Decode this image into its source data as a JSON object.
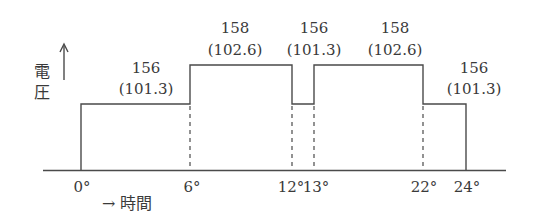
{
  "diagram": {
    "type": "step-voltage-time",
    "y_axis_label": [
      "電",
      "圧"
    ],
    "x_axis_label": "→ 時間",
    "colors": {
      "line": "#4a4a4a",
      "text": "#3a3a3a",
      "background": "#ffffff"
    },
    "segments": [
      {
        "from": "0°",
        "to": "6°",
        "value": "156",
        "sub": "(101.3)",
        "level": "low"
      },
      {
        "from": "6°",
        "to": "12°",
        "value": "158",
        "sub": "(102.6)",
        "level": "high"
      },
      {
        "from": "12°",
        "to": "13°",
        "value": "156",
        "sub": "(101.3)",
        "level": "low"
      },
      {
        "from": "13°",
        "to": "22°",
        "value": "158",
        "sub": "(102.6)",
        "level": "high"
      },
      {
        "from": "22°",
        "to": "24°",
        "value": "156",
        "sub": "(101.3)",
        "level": "low"
      }
    ],
    "ticks": [
      "0°",
      "6°",
      "12°",
      "13°",
      "22°",
      "24°"
    ]
  }
}
